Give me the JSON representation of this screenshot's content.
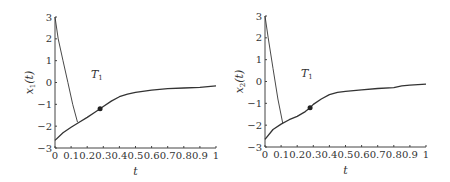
{
  "chart_data": [
    {
      "type": "line",
      "title": "",
      "xlabel": "t",
      "ylabel": "x_1(t)",
      "ylabel_display": "x",
      "ylabel_sub": "1",
      "xlim": [
        0,
        1
      ],
      "ylim": [
        -3,
        3
      ],
      "xticks": [
        "0",
        "0.1",
        "0.2",
        "0.3",
        "0.4",
        "0.5",
        "0.6",
        "0.7",
        "0.8",
        "0.9",
        "1"
      ],
      "yticks": [
        "3",
        "2",
        "1",
        "0",
        "-1",
        "-2",
        "-3"
      ],
      "grid": false,
      "annotation": {
        "text": "T",
        "sub": "1",
        "x": 0.26,
        "y": 0.2
      },
      "marker": {
        "x": 0.28,
        "y": -1.2
      },
      "series": [
        {
          "name": "trajectory_main",
          "x": [
            0,
            0.05,
            0.1,
            0.15,
            0.2,
            0.25,
            0.28,
            0.3,
            0.35,
            0.4,
            0.45,
            0.5,
            0.6,
            0.7,
            0.8,
            0.9,
            1.0
          ],
          "values": [
            -2.65,
            -2.3,
            -2.05,
            -1.82,
            -1.6,
            -1.35,
            -1.2,
            -1.1,
            -0.85,
            -0.65,
            -0.53,
            -0.45,
            -0.35,
            -0.28,
            -0.25,
            -0.22,
            -0.15
          ]
        },
        {
          "name": "trajectory_initial",
          "x": [
            0,
            0.02,
            0.05,
            0.08,
            0.11,
            0.14
          ],
          "values": [
            3.0,
            2.0,
            1.0,
            0.0,
            -1.0,
            -1.82
          ]
        }
      ]
    },
    {
      "type": "line",
      "title": "",
      "xlabel": "t",
      "ylabel": "x_2(t)",
      "ylabel_display": "x",
      "ylabel_sub": "2",
      "xlim": [
        0,
        1
      ],
      "ylim": [
        -3,
        3
      ],
      "xticks": [
        "0",
        "0.1",
        "0.2",
        "0.3",
        "0.4",
        "0.5",
        "0.6",
        "0.7",
        "0.8",
        "0.9",
        "1"
      ],
      "yticks": [
        "3",
        "2",
        "1",
        "0",
        "-1",
        "-2",
        "-3"
      ],
      "grid": false,
      "annotation": {
        "text": "T",
        "sub": "1",
        "x": 0.26,
        "y": 0.2
      },
      "marker": {
        "x": 0.28,
        "y": -1.2
      },
      "series": [
        {
          "name": "trajectory_main",
          "x": [
            0,
            0.05,
            0.1,
            0.15,
            0.2,
            0.25,
            0.28,
            0.3,
            0.35,
            0.4,
            0.45,
            0.5,
            0.6,
            0.7,
            0.8,
            0.85,
            0.9,
            1.0
          ],
          "values": [
            -2.65,
            -2.2,
            -1.95,
            -1.75,
            -1.6,
            -1.38,
            -1.2,
            -1.05,
            -0.8,
            -0.6,
            -0.5,
            -0.45,
            -0.38,
            -0.32,
            -0.28,
            -0.2,
            -0.17,
            -0.12
          ]
        },
        {
          "name": "trajectory_initial",
          "x": [
            0,
            0.02,
            0.05,
            0.08,
            0.11
          ],
          "values": [
            3.0,
            2.0,
            0.6,
            -0.8,
            -1.9
          ]
        }
      ]
    }
  ]
}
